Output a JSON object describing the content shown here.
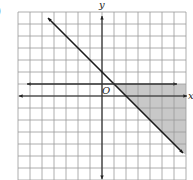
{
  "part_label": ")",
  "axes": {
    "x_label": "x",
    "y_label": "y",
    "origin_label": "O"
  },
  "grid": {
    "x_min": -7,
    "x_max": 7,
    "y_min": -7,
    "y_max": 7,
    "unit_px": 12,
    "origin_px": [
      102,
      96
    ],
    "line_color": "#9a9a9a"
  },
  "boundaries": [
    {
      "name": "diagonal",
      "equation": "y = -x + 2",
      "from": [
        -4.5,
        6.5
      ],
      "to": [
        6.75,
        -4.75
      ],
      "style": "solid",
      "color": "#1a1a1a"
    },
    {
      "name": "horizontal",
      "equation": "y = 1",
      "from": [
        -6.25,
        1
      ],
      "to": [
        6.25,
        1
      ],
      "style": "solid",
      "color": "#333333"
    }
  ],
  "shaded_region": {
    "description": "y <= 1 and y >= -x + 2",
    "polygon": [
      [
        1,
        1
      ],
      [
        7,
        1
      ],
      [
        7,
        -4.9
      ],
      [
        6.75,
        -4.75
      ]
    ],
    "color": "#c8c8c8"
  }
}
